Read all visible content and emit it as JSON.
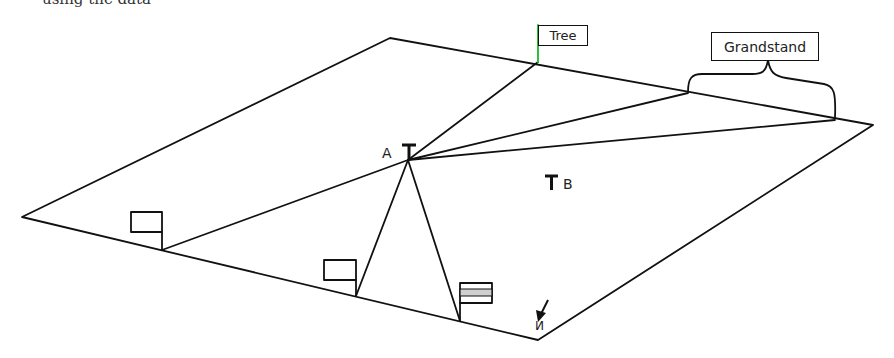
{
  "header": {
    "cropped_text": "using the data"
  },
  "diagram": {
    "type": "surveying-field-sketch",
    "field_corners": [
      [
        22,
        217
      ],
      [
        390,
        38
      ],
      [
        873,
        125
      ],
      [
        538,
        340
      ]
    ],
    "stations": [
      {
        "id": "A",
        "label": "A",
        "x": 408,
        "y": 160
      },
      {
        "id": "B",
        "label": "B",
        "x": 552,
        "y": 182
      }
    ],
    "landmarks": {
      "tree": {
        "label": "Tree",
        "x": 538,
        "y": 62,
        "flag_color": "#2bbf3a"
      },
      "grandstand": {
        "label": "Grandstand",
        "left": [
          688,
          93
        ],
        "right": [
          835,
          120
        ]
      }
    },
    "flags": [
      {
        "name": "flag-left",
        "x": 162,
        "y": 250,
        "style": "plain"
      },
      {
        "name": "flag-middle",
        "x": 356,
        "y": 296,
        "style": "plain"
      },
      {
        "name": "flag-right",
        "x": 460,
        "y": 321,
        "style": "striped"
      }
    ],
    "north": {
      "label": "N",
      "x": 540,
      "y": 325
    },
    "line_color": "#111111"
  }
}
